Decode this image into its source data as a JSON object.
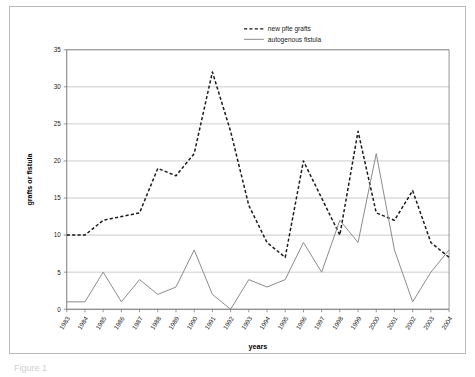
{
  "figure": {
    "caption": "Figure 1"
  },
  "chart_data": {
    "type": "line",
    "title": "",
    "xlabel": "years",
    "ylabel": "grafts or fistula",
    "ylim": [
      0,
      35
    ],
    "yticks": [
      0,
      5,
      10,
      15,
      20,
      25,
      30,
      35
    ],
    "grid": true,
    "legend_position": "top-center",
    "x": [
      "1983",
      "1984",
      "1985",
      "1986",
      "1987",
      "1988",
      "1989",
      "1990",
      "1991",
      "1992",
      "1993",
      "1994",
      "1995",
      "1996",
      "1997",
      "1998",
      "1999",
      "2000",
      "2001",
      "2002",
      "2003",
      "2004"
    ],
    "series": [
      {
        "name": "new pfte grafts",
        "style": "dashed",
        "color": "#1a1a1a",
        "values": [
          10,
          10,
          12,
          12.5,
          13,
          19,
          18,
          21,
          32,
          24,
          14,
          9,
          7,
          20,
          15,
          10,
          24,
          13,
          12,
          16,
          9,
          7
        ]
      },
      {
        "name": "autogenous fistula",
        "style": "solid",
        "color": "#8a8a8a",
        "values": [
          1,
          1,
          5,
          1,
          4,
          2,
          3,
          8,
          2,
          0,
          4,
          3,
          4,
          9,
          5,
          12,
          9,
          21,
          8,
          1,
          5,
          8
        ]
      }
    ],
    "series_tail": [
      {
        "name": "new pfte grafts",
        "style": "dashed",
        "color": "#1a1a1a",
        "values": [
          12,
          16,
          9,
          9,
          1,
          5
        ]
      }
    ],
    "axis_colors": {
      "gridline": "#bfbfbf",
      "axisline": "#7a7a7a",
      "text": "#1b1b1b"
    }
  }
}
